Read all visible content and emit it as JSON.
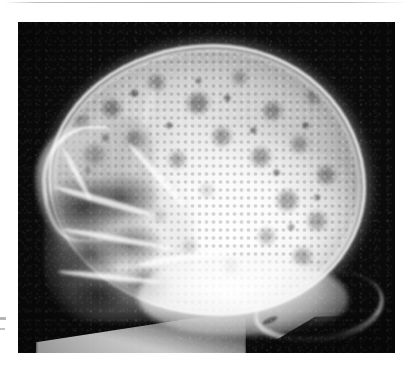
{
  "page": {
    "background_color": "#ffffff",
    "width": 412,
    "height": 371,
    "top_rule_color": "#b2b2b5"
  },
  "radiograph": {
    "title": "Lateral skull radiograph",
    "modality": "X-ray",
    "projection": "lateral",
    "body_part": "skull",
    "panel": {
      "x": 18,
      "y": 22,
      "width": 377,
      "height": 331,
      "background_color": "#0b0b0c",
      "bone_color": "#f5f5f5",
      "lesion_color": "#2e2e30"
    },
    "findings": {
      "pattern": "pepper-pot / moth-eaten calvarium",
      "description": "Multiple well-defined punched-out lytic lucencies scattered throughout the cranial vault",
      "regions": [
        "frontal bone",
        "parietal bone",
        "occipital bone",
        "facial bones and paranasal sinuses",
        "skull base"
      ]
    },
    "anatomy": [
      {
        "name": "scalp-soft-tissue",
        "label": "Scalp soft tissue halo"
      },
      {
        "name": "calvarial-outer-table",
        "label": "Outer table of calvarium"
      },
      {
        "name": "diploic-space",
        "label": "Diploic space"
      },
      {
        "name": "frontal-bone",
        "label": "Frontal bone"
      },
      {
        "name": "orbital-roof",
        "label": "Orbital roof"
      },
      {
        "name": "zygomatic-arch",
        "label": "Zygomatic arch"
      },
      {
        "name": "maxilla",
        "label": "Maxilla"
      },
      {
        "name": "sphenoid-wing",
        "label": "Greater wing of sphenoid"
      },
      {
        "name": "petrous-ridge",
        "label": "Petrous ridge"
      },
      {
        "name": "skull-base",
        "label": "Skull base"
      },
      {
        "name": "occipital-bone",
        "label": "Occipital bone"
      },
      {
        "name": "coronal-suture",
        "label": "Coronal suture"
      },
      {
        "name": "neck-soft-tissue",
        "label": "Neck soft tissue"
      }
    ]
  },
  "margin_marks": {
    "mark_1": "",
    "mark_2": "",
    "color": "#9a9a9a"
  },
  "caption": {
    "text": ""
  }
}
